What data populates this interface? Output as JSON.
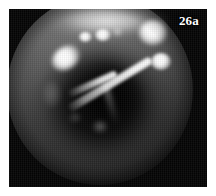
{
  "figure": {
    "label": "26a",
    "label_color": "#ffffff",
    "caption": "",
    "modality": "endoscopic still frame",
    "plate_background_color": "#ffffff",
    "frame_background_color": "#040404"
  },
  "image": {
    "kind": "grayscale-endoscopic-photograph",
    "field_of_view_shape": "circle",
    "palette": {
      "background": "#040404",
      "mucosa_mid": "#9d9d9d",
      "mucosa_shadow": "#3e3e3e",
      "cavity": "#000000",
      "specular": "#ffffff"
    },
    "features": [
      {
        "name": "superior-light-band",
        "description": "bright illuminated band across the top of the lumen"
      },
      {
        "name": "specular-top-right",
        "description": "large bright specular reflection, upper right"
      },
      {
        "name": "specular-top-mid-a",
        "description": "small bright specular reflection, upper centre"
      },
      {
        "name": "specular-top-mid-b",
        "description": "small bright specular reflection, upper centre left"
      },
      {
        "name": "specular-top-mid-c",
        "description": "faint specular reflection, upper centre right"
      },
      {
        "name": "specular-left-lateral",
        "description": "elongated bright reflection on the left lateral wall"
      },
      {
        "name": "specular-instrument-tip",
        "description": "bright reflection at the tip of the primary instrument"
      },
      {
        "name": "instrument-primary",
        "description": "long tapering bright rod running lower-left to upper-right"
      },
      {
        "name": "instrument-secondary",
        "description": "shorter bright strut angling up from the centre"
      },
      {
        "name": "instrument-tertiary",
        "description": "faint strut descending toward the lower centre"
      },
      {
        "name": "central-cavity",
        "description": "dark central cavity between the structures"
      },
      {
        "name": "dim-reflection-a",
        "description": "faint mucosal reflection low in the field"
      },
      {
        "name": "dim-reflection-b",
        "description": "faint mucosal reflection lower left of centre"
      },
      {
        "name": "dim-reflection-c",
        "description": "faint mucosal reflection on the left wall"
      }
    ]
  }
}
